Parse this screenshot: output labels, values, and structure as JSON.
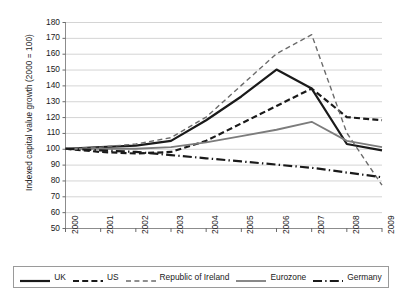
{
  "chart_data": {
    "type": "line",
    "title": "",
    "xlabel": "",
    "ylabel": "Indexed capital value growth (2000 = 100)",
    "x": [
      "2000",
      "2001",
      "2002",
      "2003",
      "2004",
      "2005",
      "2006",
      "2007",
      "2008",
      "2009"
    ],
    "categories": [
      "2000",
      "2001",
      "2002",
      "2003",
      "2004",
      "2005",
      "2006",
      "2007",
      "2008",
      "2009"
    ],
    "ylim": [
      50,
      180
    ],
    "yticks": [
      50,
      60,
      70,
      80,
      90,
      100,
      110,
      120,
      130,
      140,
      150,
      160,
      170,
      180
    ],
    "grid": "horizontal",
    "legend_position": "bottom",
    "series": [
      {
        "name": "UK",
        "style": "solid",
        "color": "#1a1a1a",
        "width": 2.2,
        "values": [
          100,
          101,
          102,
          105,
          118,
          133,
          150,
          138,
          103,
          99
        ]
      },
      {
        "name": "US",
        "style": "dashed",
        "color": "#1a1a1a",
        "width": 2.2,
        "values": [
          100,
          98,
          97,
          98,
          105,
          116,
          127,
          138,
          120,
          118
        ]
      },
      {
        "name": "Republic of Ireland",
        "style": "dashed-thin",
        "color": "#6b6b6b",
        "width": 1.4,
        "values": [
          100,
          101,
          103,
          107,
          120,
          140,
          160,
          172,
          110,
          77
        ]
      },
      {
        "name": "Eurozone",
        "style": "solid",
        "color": "#7c7c7c",
        "width": 1.8,
        "values": [
          100,
          100,
          100,
          101,
          104,
          108,
          112,
          117,
          105,
          101
        ]
      },
      {
        "name": "Germany",
        "style": "dash-dot",
        "color": "#1a1a1a",
        "width": 2.2,
        "values": [
          100,
          99,
          98,
          96,
          94,
          92,
          90,
          88,
          85,
          82
        ]
      }
    ]
  },
  "axis": {
    "y_labels": [
      "180",
      "170",
      "160",
      "150",
      "140",
      "130",
      "120",
      "110",
      "100",
      "90",
      "80",
      "70",
      "60",
      "50"
    ],
    "x_labels": [
      "2000",
      "2001",
      "2002",
      "2003",
      "2004",
      "2005",
      "2006",
      "2007",
      "2008",
      "2009"
    ],
    "y_title": "Indexed capital value growth (2000 = 100)"
  },
  "legend": {
    "items": [
      {
        "label": "UK"
      },
      {
        "label": "US"
      },
      {
        "label": "Republic of Ireland"
      },
      {
        "label": "Eurozone"
      },
      {
        "label": "Germany"
      }
    ]
  }
}
